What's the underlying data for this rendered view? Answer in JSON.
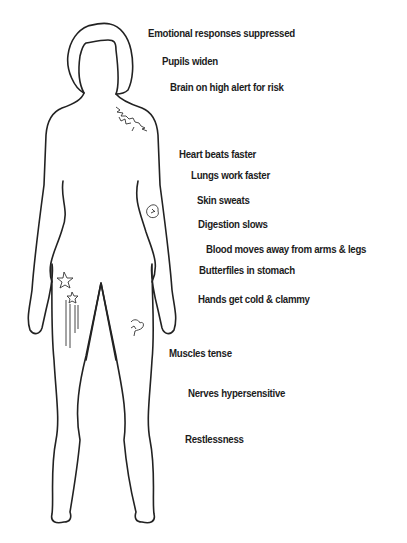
{
  "diagram": {
    "type": "body-outline-annotated",
    "line_color": "#222222",
    "background": "#ffffff",
    "labels": [
      {
        "id": "emotional",
        "text": "Emotional responses suppressed",
        "x": 148,
        "y": 27
      },
      {
        "id": "pupils",
        "text": "Pupils widen",
        "x": 162,
        "y": 55
      },
      {
        "id": "brain",
        "text": "Brain on high alert for risk",
        "x": 170,
        "y": 81
      },
      {
        "id": "heart",
        "text": "Heart beats faster",
        "x": 179,
        "y": 148
      },
      {
        "id": "lungs",
        "text": "Lungs work faster",
        "x": 191,
        "y": 169
      },
      {
        "id": "skin",
        "text": "Skin sweats",
        "x": 197,
        "y": 194
      },
      {
        "id": "digestion",
        "text": "Digestion slows",
        "x": 198,
        "y": 218
      },
      {
        "id": "blood",
        "text": "Blood moves away from arms & legs",
        "x": 206,
        "y": 243
      },
      {
        "id": "butterflies",
        "text": "Butterfiles in stomach",
        "x": 199,
        "y": 264
      },
      {
        "id": "hands",
        "text": "Hands get cold & clammy",
        "x": 198,
        "y": 293
      },
      {
        "id": "muscles",
        "text": "Muscles tense",
        "x": 169,
        "y": 347
      },
      {
        "id": "nerves",
        "text": "Nerves hypersensitive",
        "x": 188,
        "y": 387
      },
      {
        "id": "restlessness",
        "text": "Restlessness",
        "x": 185,
        "y": 433
      }
    ],
    "markings": [
      {
        "id": "shoulder-scribble",
        "location": "right shoulder"
      },
      {
        "id": "forearm-scribble",
        "location": "left forearm"
      },
      {
        "id": "hip-stars",
        "location": "right hip/thigh"
      },
      {
        "id": "thigh-scribble",
        "location": "left thigh"
      }
    ]
  }
}
